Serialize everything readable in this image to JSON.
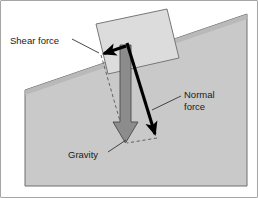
{
  "figure": {
    "type": "physics-force-diagram",
    "background_color": "#ffffff",
    "frame": {
      "border_color": "#4d4d4d",
      "border_width": 1
    },
    "colors": {
      "slope_fill": "#c9c9c9",
      "slope_top_edge": "#8a8a8a",
      "slope_outline": "#6e6e6e",
      "block_fill": "#dcdcdc",
      "block_outline": "#777777",
      "gravity_arrow_fill": "#8c8c8c",
      "gravity_arrow_outline": "#4a4a4a",
      "vector_arrow_color": "#000000",
      "dashed_line_color": "#555555",
      "leader_line_color": "#333333",
      "text_color": "#1a1a1a"
    },
    "labels": [
      {
        "id": "shear-force",
        "text": "Shear force",
        "lines": [
          "Shear force"
        ],
        "x": 10,
        "y": 41,
        "anchor": "start",
        "leader": {
          "x1": 72,
          "y1": 39,
          "x2": 99,
          "y2": 53
        }
      },
      {
        "id": "normal-force",
        "text": "Normal force",
        "lines": [
          "Normal",
          "force"
        ],
        "x": 184,
        "y": 95,
        "anchor": "start",
        "leader": {
          "x1": 181,
          "y1": 96,
          "x2": 152,
          "y2": 110
        }
      },
      {
        "id": "gravity",
        "text": "Gravity",
        "lines": [
          "Gravity"
        ],
        "x": 68,
        "y": 155,
        "anchor": "start",
        "leader": {
          "x1": 108,
          "y1": 152,
          "x2": 126,
          "y2": 140
        }
      }
    ],
    "vectors": [
      {
        "id": "gravity-vector",
        "label": "Gravity",
        "style": "filled-gray-block-arrow",
        "from": {
          "x": 125,
          "y": 45
        },
        "to": {
          "x": 126,
          "y": 142
        },
        "direction": "down"
      },
      {
        "id": "shear-force-vector",
        "label": "Shear force",
        "style": "thick-black-arrow",
        "from": {
          "x": 125,
          "y": 46
        },
        "to": {
          "x": 101,
          "y": 54
        },
        "direction": "up-slope-left"
      },
      {
        "id": "normal-force-vector",
        "label": "Normal force",
        "style": "thick-black-arrow",
        "from": {
          "x": 128,
          "y": 44
        },
        "to": {
          "x": 157,
          "y": 137
        },
        "direction": "down-right-into-slope"
      }
    ],
    "dashed_construction_lines": [
      {
        "id": "shear-component-dashed",
        "x1": 101,
        "y1": 55,
        "x2": 126,
        "y2": 142
      },
      {
        "id": "normal-component-dashed",
        "x1": 157,
        "y1": 138,
        "x2": 127,
        "y2": 143
      }
    ],
    "shapes": {
      "slope": {
        "id": "hillside-slope",
        "description": "Gray wedge representing the hillside with an inclined upper surface",
        "points": "25,90 247,14 247,186 25,186"
      },
      "block": {
        "id": "rock-block",
        "description": "Light gray rotated rectangle resting on the slope",
        "points": "96,24 167,9 179,58 108,74"
      }
    }
  }
}
